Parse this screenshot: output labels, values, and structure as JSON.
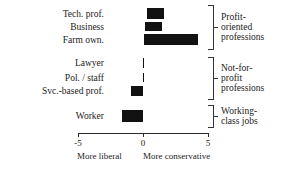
{
  "chart_data": {
    "type": "bar",
    "orientation": "horizontal",
    "title": "",
    "subtitle": "",
    "xlabel": "",
    "ylabel": "",
    "xlim": [
      -5,
      5
    ],
    "xticks": [
      -5,
      0,
      5
    ],
    "xtick_labels": [
      "-5",
      "0",
      "5"
    ],
    "grid": false,
    "legend": false,
    "axis_caption_left": "More liberal",
    "axis_caption_right": "More conservative",
    "categories": [
      "Tech. prof.",
      "Business",
      "Farm own.",
      "Lawyer",
      "Pol. / staff",
      "Svc.-based prof.",
      "Worker"
    ],
    "bars": [
      {
        "category": "Tech. prof.",
        "start": 0.3,
        "end": 1.6
      },
      {
        "category": "Business",
        "start": 0.15,
        "end": 1.45
      },
      {
        "category": "Farm own.",
        "start": 0.1,
        "end": 4.2
      },
      {
        "category": "Lawyer",
        "start": 0.0,
        "end": 0.05
      },
      {
        "category": "Pol. / staff",
        "start": 0.0,
        "end": 0.05
      },
      {
        "category": "Svc.-based prof.",
        "start": -0.9,
        "end": 0.0
      },
      {
        "category": "Worker",
        "start": -1.6,
        "end": 0.0
      }
    ],
    "groups": [
      {
        "label_line1": "Profit-",
        "label_line2": "oriented",
        "label_line3": "professions"
      },
      {
        "label_line1": "Not-for-",
        "label_line2": "profit",
        "label_line3": "professions"
      },
      {
        "label_line1": "Working-",
        "label_line2": "class jobs",
        "label_line3": ""
      }
    ],
    "bar_color": "#121212",
    "axis_color": "#2a2a2a"
  }
}
